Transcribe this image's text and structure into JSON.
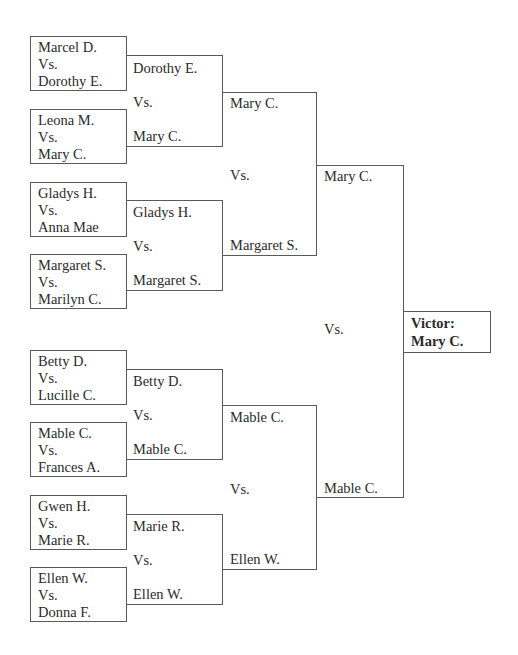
{
  "round1": [
    {
      "top": "Marcel D.",
      "vs": "Vs.",
      "bottom": "Dorothy E."
    },
    {
      "top": "Leona M.",
      "vs": "Vs.",
      "bottom": "Mary C."
    },
    {
      "top": "Gladys H.",
      "vs": "Vs.",
      "bottom": "Anna Mae"
    },
    {
      "top": "Margaret S.",
      "vs": "Vs.",
      "bottom": "Marilyn C."
    },
    {
      "top": "Betty D.",
      "vs": "Vs.",
      "bottom": "Lucille C."
    },
    {
      "top": "Mable C.",
      "vs": "Vs.",
      "bottom": "Frances A."
    },
    {
      "top": "Gwen H.",
      "vs": "Vs.",
      "bottom": "Marie R."
    },
    {
      "top": "Ellen W.",
      "vs": "Vs.",
      "bottom": "Donna F."
    }
  ],
  "round2": [
    {
      "top": "Dorothy E.",
      "vs": "Vs.",
      "bottom": "Mary C."
    },
    {
      "top": "Gladys H.",
      "vs": "Vs.",
      "bottom": "Margaret S."
    },
    {
      "top": "Betty D.",
      "vs": "Vs.",
      "bottom": "Mable C."
    },
    {
      "top": "Marie R.",
      "vs": "Vs.",
      "bottom": "Ellen W."
    }
  ],
  "round3": [
    {
      "top": "Mary C.",
      "vs": "Vs.",
      "bottom": "Margaret S."
    },
    {
      "top": "Mable C.",
      "vs": "Vs.",
      "bottom": "Ellen W."
    }
  ],
  "final": {
    "top": "Mary C.",
    "vs": "Vs.",
    "bottom": "Mable C."
  },
  "victor": {
    "label": "Victor:",
    "name": "Mary C."
  },
  "colors": {
    "line": "#5a5a5a",
    "text": "#2b2b2b"
  }
}
